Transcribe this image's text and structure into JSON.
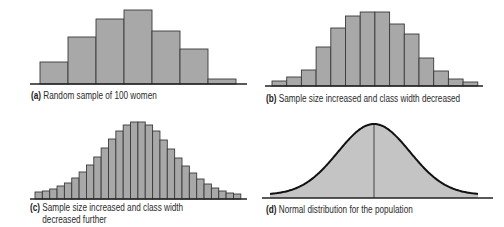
{
  "colors": {
    "bar_fill": "#a8a8a8",
    "bar_stroke": "#3a3a3a",
    "curve_fill": "#c4c4c4",
    "curve_stroke": "#111111",
    "axis": "#222222"
  },
  "panels": {
    "a": {
      "tag": "(a)",
      "caption": "Random sample of 100 women"
    },
    "b": {
      "tag": "(b)",
      "caption": "Sample size increased and class width decreased"
    },
    "c": {
      "tag": "(c)",
      "caption_line1": "Sample size increased and class width",
      "caption_line2": "decreased further"
    },
    "d": {
      "tag": "(d)",
      "caption": "Normal distribution for the population"
    }
  },
  "chart_data": [
    {
      "id": "a",
      "type": "bar",
      "title": "(a) Random sample of 100 women",
      "xlabel": "",
      "ylabel": "",
      "grid": false,
      "categories": [
        "1",
        "2",
        "3",
        "4",
        "5",
        "6",
        "7"
      ],
      "values": [
        22,
        47,
        65,
        74,
        53,
        35,
        5
      ],
      "geom": {
        "x0": 40,
        "bar_w": 28.0,
        "baseline": 84,
        "axis_x0": 30,
        "axis_x1": 247,
        "scale": 1.0
      }
    },
    {
      "id": "b",
      "type": "bar",
      "title": "(b) Sample size increased and class width decreased",
      "xlabel": "",
      "ylabel": "",
      "grid": false,
      "categories": [
        "1",
        "2",
        "3",
        "4",
        "5",
        "6",
        "7",
        "8",
        "9",
        "10",
        "11",
        "12",
        "13",
        "14"
      ],
      "values": [
        5,
        9,
        16,
        39,
        58,
        70,
        74,
        74,
        62,
        52,
        28,
        15,
        7,
        4
      ],
      "geom": {
        "x0": 272,
        "bar_w": 14.7,
        "baseline": 86,
        "axis_x0": 265,
        "axis_x1": 483,
        "scale": 1.0
      }
    },
    {
      "id": "c",
      "type": "bar",
      "title": "(c) Sample size increased and class width decreased further",
      "xlabel": "",
      "ylabel": "",
      "grid": false,
      "categories": [
        "1",
        "2",
        "3",
        "4",
        "5",
        "6",
        "7",
        "8",
        "9",
        "10",
        "11",
        "12",
        "13",
        "14",
        "15",
        "16",
        "17",
        "18",
        "19",
        "20",
        "21",
        "22",
        "23",
        "24",
        "25",
        "26",
        "27",
        "28"
      ],
      "values": [
        7,
        8,
        10,
        13,
        16,
        21,
        27,
        34,
        42,
        51,
        60,
        68,
        74,
        77,
        77,
        74,
        68,
        59,
        50,
        41,
        33,
        26,
        20,
        15,
        11,
        8,
        6,
        5
      ],
      "geom": {
        "x0": 35,
        "bar_w": 7.35,
        "baseline": 199,
        "axis_x0": 30,
        "axis_x1": 247,
        "scale": 1.0
      }
    },
    {
      "id": "d",
      "type": "area",
      "title": "(d) Normal distribution for the population",
      "xlabel": "",
      "ylabel": "",
      "grid": false,
      "distribution": "normal",
      "mean_line": true,
      "peak_height": 74,
      "geom": {
        "x_start": 270,
        "x_end": 478,
        "mean_x": 374,
        "sigma_px": 36,
        "baseline": 198,
        "axis_x0": 262,
        "axis_x1": 493
      }
    }
  ]
}
